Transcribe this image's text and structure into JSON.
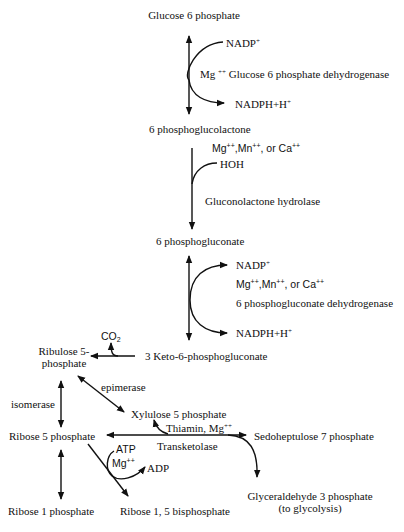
{
  "compounds": {
    "glucose_6_phosphate": "Glucose 6 phosphate",
    "phosphoglucolactone": "6 phosphoglucolactone",
    "phosphogluconate": "6 phosphogluconate",
    "keto_phosphogluconate": "3 Keto-6-phosphogluconate",
    "ribulose_5_phosphate_line1": "Ribulose 5-",
    "ribulose_5_phosphate_line2": "phosphate",
    "xylulose_5_phosphate": "Xylulose 5 phosphate",
    "ribose_5_phosphate": "Ribose 5 phosphate",
    "sedoheptulose_7_phosphate": "Sedoheptulose 7 phosphate",
    "glyceraldehyde_3_phosphate": "Glyceraldehyde 3 phosphate",
    "glyceraldehyde_note": "(to glycolysis)",
    "ribose_1_phosphate": "Ribose 1 phosphate",
    "ribose_1_5_bisphosphate": "Ribose 1, 5 bisphosphate"
  },
  "reaction1": {
    "cofactor_in": "NADP",
    "cofactor_in_sup": "+",
    "ion": "Mg",
    "ion_sup": "++",
    "enzyme": "Glucose 6 phosphate dehydrogenase",
    "cofactor_out": "NADPH+H",
    "cofactor_out_sup": "+"
  },
  "reaction2": {
    "ions": [
      {
        "name": "Mg",
        "sup": "++",
        "sep": ","
      },
      {
        "name": "Mn",
        "sup": "++",
        "sep": ", or "
      },
      {
        "name": "Ca",
        "sup": "++",
        "sep": ""
      }
    ],
    "reactant": "HOH",
    "enzyme": "Gluconolactone hydrolase"
  },
  "reaction3": {
    "cofactor_in": "NADP",
    "cofactor_in_sup": "+",
    "ions": [
      {
        "name": "Mg",
        "sup": "++",
        "sep": ","
      },
      {
        "name": "Mn",
        "sup": "++",
        "sep": ", or "
      },
      {
        "name": "Ca",
        "sup": "++",
        "sep": ""
      }
    ],
    "enzyme": "6 phosphogluconate dehydrogenase",
    "cofactor_out": "NADPH+H",
    "cofactor_out_sup": "+"
  },
  "decarboxylation": {
    "product": "CO",
    "product_sub": "2"
  },
  "epimerase": {
    "enzyme": "epimerase"
  },
  "isomerase": {
    "enzyme": "isomerase"
  },
  "transketolase": {
    "cofactors": "Thiamin, Mg",
    "cofactors_sup": "++",
    "enzyme": "Transketolase"
  },
  "kinase": {
    "atp": "ATP",
    "ion": "Mg",
    "ion_sup": "++",
    "adp": "ADP"
  },
  "colors": {
    "ink": "#111111",
    "background": "#ffffff"
  }
}
